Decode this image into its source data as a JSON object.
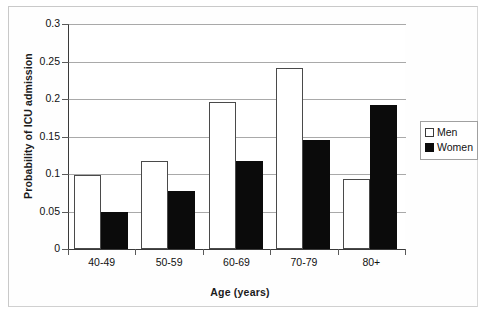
{
  "chart_data": {
    "type": "bar",
    "title": "",
    "xlabel": "Age (years)",
    "ylabel": "Probability of ICU admission",
    "categories": [
      "40-49",
      "50-59",
      "60-69",
      "70-79",
      "80+"
    ],
    "series": [
      {
        "name": "Men",
        "values": [
          0.099,
          0.118,
          0.196,
          0.242,
          0.093
        ]
      },
      {
        "name": "Women",
        "values": [
          0.049,
          0.077,
          0.117,
          0.145,
          0.192
        ]
      }
    ],
    "ylim": [
      0,
      0.3
    ],
    "ytick_labels": [
      "0.3",
      "0.25",
      "0.2",
      "0.15",
      "0.1",
      "0.05",
      "0"
    ],
    "ytick_values": [
      0.3,
      0.25,
      0.2,
      0.15,
      0.1,
      0.05,
      0
    ],
    "grid": "horizontal",
    "legend_position": "right",
    "legend_entries": [
      {
        "label": "Men",
        "swatch": "hollow-square",
        "color": "#ffffff"
      },
      {
        "label": "Women",
        "swatch": "filled-square",
        "color": "#0b0b0b"
      }
    ],
    "colors": {
      "men_fill": "#ffffff",
      "men_outline": "#4a4a4a",
      "women_fill": "#0b0b0b",
      "gridline": "#a9a9a9",
      "axis": "#3a3a3a",
      "frame": "#c9c9c9"
    }
  }
}
